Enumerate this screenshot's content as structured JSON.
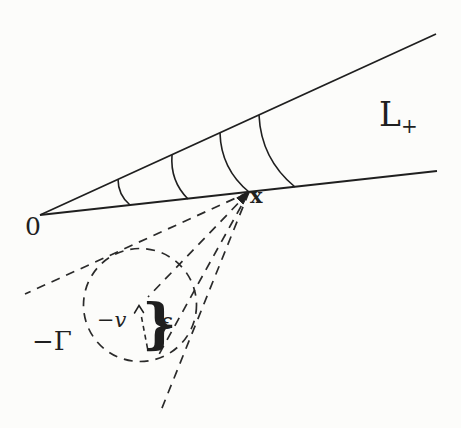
{
  "figure": {
    "background_color": "#fcfcfa",
    "ink_color": "#1f1f1f",
    "labels": {
      "origin": "0",
      "point_x": "x",
      "cone_main": "L",
      "cone_sub": "+",
      "neg_gamma": "−Γ",
      "neg_v": "−v",
      "epsilon": "ε",
      "brace": "}"
    }
  }
}
